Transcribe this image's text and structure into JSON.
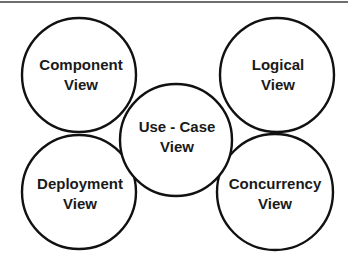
{
  "diagram": {
    "nodes": [
      {
        "id": "component",
        "line1": "Component",
        "line2": "View",
        "cx": 79,
        "cy": 75,
        "r": 57
      },
      {
        "id": "logical",
        "line1": "Logical",
        "line2": "View",
        "cx": 277,
        "cy": 75,
        "r": 57
      },
      {
        "id": "deployment",
        "line1": "Deployment",
        "line2": "View",
        "cx": 79,
        "cy": 192,
        "r": 57
      },
      {
        "id": "concurrency",
        "line1": "Concurrency",
        "line2": "View",
        "cx": 275,
        "cy": 192,
        "r": 58
      },
      {
        "id": "use-case",
        "line1": "Use - Case",
        "line2": "View",
        "cx": 176,
        "cy": 140,
        "r": 56
      }
    ],
    "colors": {
      "stroke": "#111111",
      "fill": "#ffffff",
      "text": "#1a1a1a"
    }
  }
}
